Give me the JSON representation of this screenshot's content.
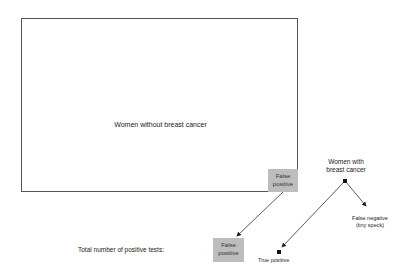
{
  "diagram": {
    "main_box_label": "Women without breast cancer",
    "false_positive_corner": [
      "False",
      "positive"
    ],
    "total_label": "Total number of positive tests:",
    "separator": "·",
    "false_positive_result": [
      "False",
      "positive"
    ],
    "women_with_cancer": [
      "Women with",
      "breast cancer"
    ],
    "false_negative": [
      "False negative",
      "(tiny speck)"
    ],
    "true_positive": "True positive",
    "colors": {
      "box_border": "#555555",
      "fp_fill": "#bdbdbd",
      "arrow": "#333333"
    }
  }
}
